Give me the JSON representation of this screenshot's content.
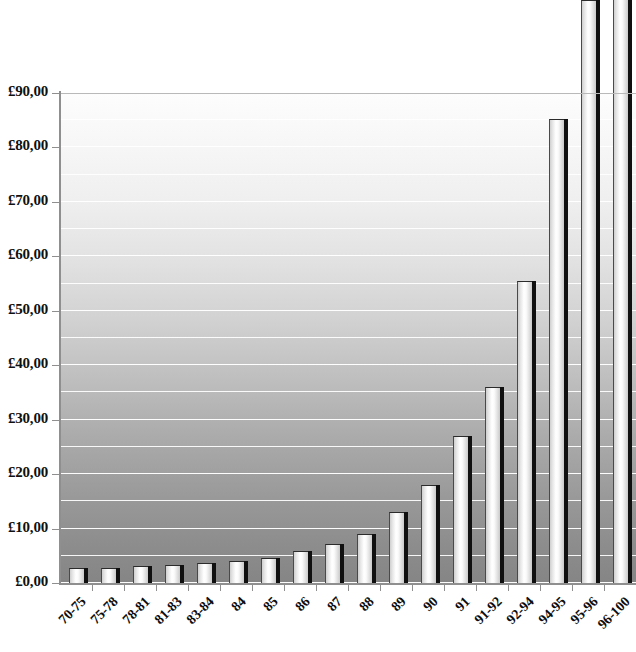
{
  "chart_data": {
    "type": "bar",
    "title": "",
    "subtitle": "",
    "xlabel": "",
    "ylabel": "",
    "currency_symbol": "£",
    "decimal_separator": ",",
    "categories": [
      "70-75",
      "75-78",
      "78-81",
      "81-83",
      "83-84",
      "84",
      "85",
      "86",
      "87",
      "88",
      "89",
      "90",
      "91",
      "91-92",
      "92-94",
      "94-95",
      "95-96",
      "96-100"
    ],
    "values": [
      2.7,
      2.8,
      3.1,
      3.3,
      3.6,
      4.0,
      4.6,
      5.9,
      7.1,
      9.0,
      13.0,
      18.0,
      27.0,
      36.0,
      55.5,
      85.2,
      107.0,
      111.0
    ],
    "clipped_bars": [
      "95-96",
      "96-100"
    ],
    "clipped_note": "Final two bars extend above the top of the visible plot area and are cut off by the image edge.",
    "ylim": [
      0,
      90
    ],
    "y_tick_step": 10,
    "gridline_step": 5,
    "grid": true,
    "legend": "none",
    "y_tick_labels": [
      "£90,00",
      "£80,00",
      "£70,00",
      "£60,00",
      "£50,00",
      "£40,00",
      "£30,00",
      "£20,00",
      "£10,00",
      "£0,00"
    ],
    "y_tick_values": [
      90,
      80,
      70,
      60,
      50,
      40,
      30,
      20,
      10,
      0
    ],
    "style": {
      "plot_background": "vertical gradient white to gray",
      "background_top_color": "#fdfdfd",
      "background_bottom_color": "#858585",
      "gridline_color": "#ffffff",
      "bar_fill_light": "#ffffff",
      "bar_edge_dark": "#101010",
      "axis_color": "#8f8f8f",
      "text_color": "#0d0d0d"
    }
  }
}
